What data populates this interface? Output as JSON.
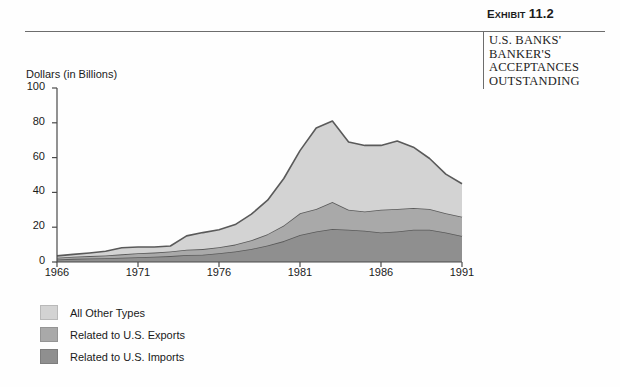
{
  "exhibit": {
    "label_prefix": "E",
    "label_word": "XHIBIT",
    "number": "11.2",
    "full_label": "EXHIBIT 11.2"
  },
  "caption": {
    "line1": "U.S. BANKS'",
    "line2": "BANKER'S",
    "line3": "ACCEPTANCES",
    "line4": "OUTSTANDING"
  },
  "colors": {
    "all_other_types": "#d3d3d3",
    "related_exports": "#a9a9a9",
    "related_imports": "#8f8f8f",
    "stroke": "#5a5a5a",
    "axis": "#4a4a4a",
    "text": "#1a1a1a"
  },
  "chart_data": {
    "type": "area",
    "stacked": true,
    "title": "",
    "xlabel": "",
    "ylabel": "Dollars (in Billions)",
    "ylim": [
      0,
      100
    ],
    "xlim": [
      1966,
      1991
    ],
    "yticks": [
      0,
      20,
      40,
      60,
      80,
      100
    ],
    "xticks": [
      1966,
      1971,
      1976,
      1981,
      1986,
      1991
    ],
    "grid": false,
    "legend_position": "below-left",
    "x": [
      1966,
      1967,
      1968,
      1969,
      1970,
      1971,
      1972,
      1973,
      1974,
      1975,
      1976,
      1977,
      1978,
      1979,
      1980,
      1981,
      1982,
      1983,
      1984,
      1985,
      1986,
      1987,
      1988,
      1989,
      1990,
      1991
    ],
    "series": [
      {
        "name": "Related to U.S. Imports",
        "color": "#8f8f8f",
        "values": [
          1.5,
          1.8,
          2.0,
          2.2,
          2.5,
          2.8,
          3.0,
          3.4,
          4.0,
          4.2,
          5.0,
          6.0,
          7.5,
          9.5,
          12.0,
          15.5,
          17.5,
          19.0,
          18.5,
          18.0,
          17.0,
          17.5,
          18.5,
          18.5,
          17.0,
          15.0
        ]
      },
      {
        "name": "Related to U.S. Exports",
        "color": "#a9a9a9",
        "values": [
          1.0,
          1.2,
          1.4,
          1.6,
          1.9,
          2.2,
          2.4,
          2.6,
          3.0,
          3.2,
          3.5,
          4.0,
          5.0,
          6.5,
          9.0,
          12.5,
          13.0,
          15.5,
          11.5,
          11.0,
          13.0,
          13.0,
          12.5,
          12.0,
          11.0,
          11.0
        ]
      },
      {
        "name": "All Other Types",
        "color": "#d3d3d3",
        "values": [
          1.0,
          1.4,
          1.8,
          2.4,
          3.8,
          3.6,
          3.2,
          3.2,
          8.0,
          9.5,
          10.0,
          11.5,
          15.0,
          19.5,
          27.0,
          36.0,
          46.5,
          46.5,
          39.0,
          38.0,
          37.0,
          39.0,
          35.0,
          29.0,
          22.5,
          19.0
        ]
      }
    ],
    "totals": [
      3.5,
      4.4,
      5.2,
      6.2,
      8.2,
      8.6,
      8.6,
      9.2,
      15.0,
      16.9,
      18.5,
      21.5,
      27.5,
      35.5,
      48.0,
      64.0,
      77.0,
      81.0,
      69.0,
      67.0,
      67.0,
      69.5,
      66.0,
      59.5,
      50.5,
      45.0
    ]
  },
  "legend": {
    "items": [
      {
        "label": "All Other Types",
        "color": "#d3d3d3"
      },
      {
        "label": "Related to U.S. Exports",
        "color": "#a9a9a9"
      },
      {
        "label": "Related to U.S. Imports",
        "color": "#8f8f8f"
      }
    ]
  }
}
